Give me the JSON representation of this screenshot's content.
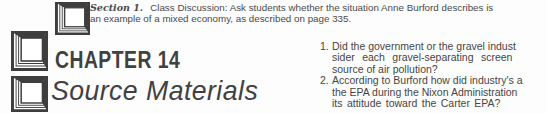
{
  "colors": {
    "ink": "#414141",
    "body_text": "#4a4a4a",
    "background": "#fdfdfd"
  },
  "banner": {
    "chapter_title": "CHAPTER 14",
    "subtitle": "Source Materials",
    "logo_icon": "nested-squares-depth-icon",
    "logo_icon_count": 3
  },
  "intro": {
    "section_label": "Section 1.",
    "line1": "Class Discussion: Ask students whether the situation Anne Burford describes is",
    "line2": "an example of a mixed economy, as described on page 335."
  },
  "questions": [
    {
      "number": "1.",
      "lines": [
        "Did the government or the gravel indust",
        "sider each gravel-separating screen",
        "source of air pollution?"
      ]
    },
    {
      "number": "2.",
      "lines": [
        "According to Burford how did industry's a",
        "the EPA during the Nixon Administration",
        "its attitude toward the Carter EPA?"
      ]
    }
  ]
}
